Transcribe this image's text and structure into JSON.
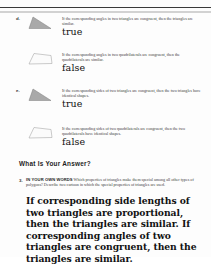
{
  "page": {
    "background_color": "#fdfdfd",
    "rule_color": "#3a3a3a"
  },
  "problems": [
    {
      "letter": "d.",
      "shape": "shaded-right-triangle",
      "statement": "If the corresponding angles in two triangles are congruent, then the triangles are similar.",
      "answer": "true"
    },
    {
      "letter": "",
      "shape": "outline-quadrilateral",
      "statement": "If the corresponding angles in two quadrilaterals are congruent, then the quadrilaterals are similar.",
      "answer": "false"
    },
    {
      "letter": "e.",
      "shape": "shaded-right-triangle",
      "statement": "If the corresponding sides of two triangles are congruent, then the two triangles have identical shapes.",
      "answer": "true"
    },
    {
      "letter": "",
      "shape": "outline-quadrilateral",
      "statement": "If the corresponding sides of two quadrilaterals are congruent, then the two quadrilaterals have identical shapes.",
      "answer": "false"
    }
  ],
  "what_is_your_answer": {
    "heading": "What Is Your Answer?",
    "question_number": "3.",
    "lead_in": "IN YOUR OWN WORDS",
    "prompt": " Which properties of triangles make them special among all other types of polygons? Describe two cartoon in which the special properties of triangles are used.",
    "handwritten_answer": "If corresponding side lengths of two triangles are proportional, then the triangles are similar. If corresponding angles of two triangles are congruent, then the triangles are similar."
  }
}
